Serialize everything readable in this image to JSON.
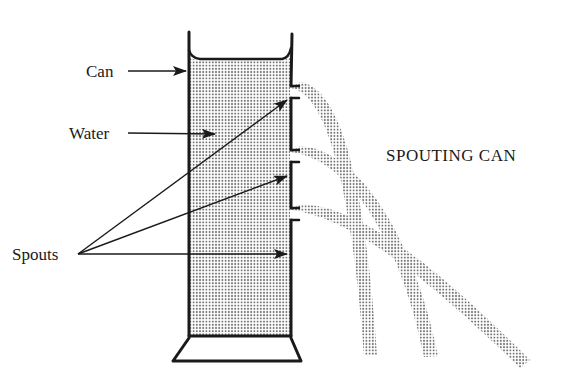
{
  "diagram": {
    "title": "SPOUTING CAN",
    "labels": {
      "can": "Can",
      "water": "Water",
      "spouts": "Spouts"
    },
    "colors": {
      "ink": "#1a1a1a",
      "water_dots": "#6e6e6e",
      "background": "#ffffff"
    },
    "elements": {
      "spout_count": 3,
      "streams": [
        "top-spout-stream",
        "middle-spout-stream",
        "bottom-spout-stream"
      ]
    }
  }
}
